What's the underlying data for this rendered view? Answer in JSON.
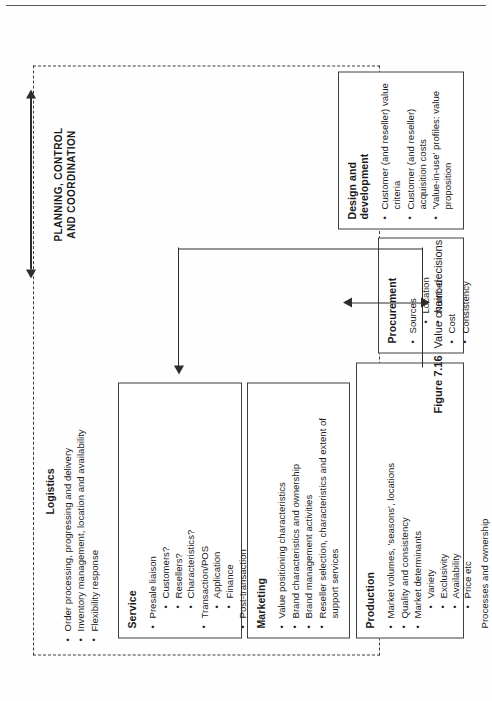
{
  "figure": {
    "number": "Figure 7.16",
    "caption": "Value chain: decisions"
  },
  "planning": {
    "label": "PLANNING, CONTROL\nAND COORDINATION",
    "line1": "PLANNING, CONTROL",
    "line2": "AND COORDINATION"
  },
  "logistics": {
    "title": "Logistics",
    "items": [
      "Order processing, progressing and delivery",
      "Inventory management, location and availability",
      "Flexibility response"
    ]
  },
  "boxes": {
    "service": {
      "title": "Service",
      "items": [
        {
          "text": "Presale liaison",
          "children": [
            "Customers?",
            "Resellers?",
            "Characteristics?"
          ]
        },
        {
          "text": "Transaction/POS",
          "children": [
            "Application",
            "Finance"
          ]
        },
        {
          "text": "Post-transaction",
          "children": [
            "Installation",
            "Training",
            "Warranty",
            "Product/service liability"
          ]
        }
      ]
    },
    "marketing": {
      "title": "Marketing",
      "items": [
        {
          "text": "Value positioning characteristics",
          "children": []
        },
        {
          "text": "Brand characteristics and ownership",
          "children": []
        },
        {
          "text": "Brand management activities",
          "children": []
        },
        {
          "text": "Reseller selection, characteristics and extent of support services",
          "children": []
        }
      ]
    },
    "production": {
      "title": "Production",
      "items": [
        {
          "text": "Market volumes, 'seasons', locations",
          "children": []
        },
        {
          "text": "Quality and consistency",
          "children": []
        },
        {
          "text": "Market determinants",
          "children": [
            "Variety",
            "Exclusivity",
            "Availability",
            "Price etc"
          ]
        }
      ],
      "note": "Processes and ownership"
    },
    "procurement": {
      "title": "Procurement",
      "items": [
        {
          "text": "Sources",
          "children": [
            "Location",
            "Number"
          ]
        },
        {
          "text": "Cost",
          "children": []
        },
        {
          "text": "Consistency",
          "children": []
        }
      ]
    },
    "design": {
      "title": "Design and development",
      "title_line1": "Design and",
      "title_line2": "development",
      "items": [
        {
          "text": "Customer (and reseller) value criteria",
          "children": []
        },
        {
          "text": "Customer (and reseller) acquisition costs",
          "children": []
        },
        {
          "text": "'Value-in-use' profiles: value proposition",
          "children": []
        }
      ]
    }
  },
  "colors": {
    "ink": "#1b1b1b",
    "rule": "#3f3f3f",
    "arrow": "#2d2d2d",
    "paper": "#ffffff"
  }
}
